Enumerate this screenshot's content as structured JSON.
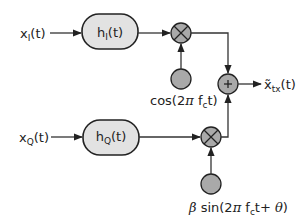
{
  "diagram": {
    "type": "IQ modulator block diagram",
    "inputs": {
      "in_phase": {
        "base": "x",
        "sub": "I",
        "arg": "(t)"
      },
      "quadrature": {
        "base": "x",
        "sub": "Q",
        "arg": "(t)"
      }
    },
    "filters": {
      "in_phase": {
        "base": "h",
        "sub": "I",
        "arg": "(t)"
      },
      "quadrature": {
        "base": "h",
        "sub": "Q",
        "arg": "(t)"
      }
    },
    "mixers": {
      "in_phase": {
        "symbol": "×"
      },
      "quadrature": {
        "symbol": "×"
      }
    },
    "oscillators": {
      "in_phase": {
        "pre": "cos(2",
        "pi": "π",
        "f": " f",
        "fsub": "c",
        "post": "t)"
      },
      "quadrature": {
        "beta": "β",
        "pre": " sin(2",
        "pi": "π",
        "f": " f",
        "fsub": "c",
        "mid": "t+ ",
        "theta": "θ",
        "post": ")"
      }
    },
    "adder": {
      "symbol": "+"
    },
    "output": {
      "base": "x̃",
      "sub": "tx",
      "arg": "(t)"
    },
    "colors": {
      "block_fill": "#e2e2e2",
      "node_fill": "#a9a9a9",
      "stroke": "#222222"
    }
  }
}
